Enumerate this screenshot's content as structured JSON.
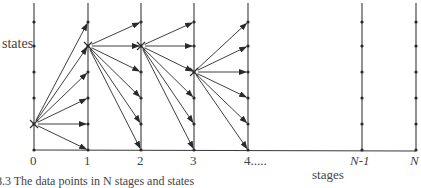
{
  "diagram": {
    "ylabel": "states",
    "xlabel": "stages",
    "stage_labels": [
      "0",
      "1",
      "2",
      "3",
      "4.....",
      "N-1",
      "N"
    ],
    "caption_fragment": "8.3  The data points in N stages and states",
    "stages_x": [
      34,
      88,
      141,
      194,
      248,
      362,
      416
    ],
    "state_levels_y": [
      22,
      46,
      72,
      98,
      124,
      150
    ],
    "baseline_y": 150,
    "selected_nodes": [
      {
        "stage": 0,
        "state_y": 124
      },
      {
        "stage": 1,
        "state_y": 46
      },
      {
        "stage": 2,
        "state_y": 46
      },
      {
        "stage": 3,
        "state_y": 72
      }
    ],
    "colors": {
      "line": "#3a3a3a",
      "text": "#444444"
    }
  }
}
